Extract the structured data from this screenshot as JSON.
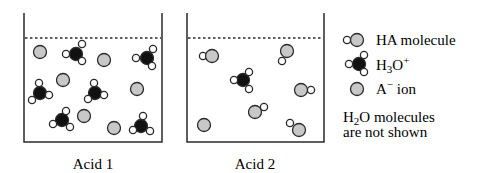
{
  "colors": {
    "stroke": "#2a2a2a",
    "gray_fill": "#c8c8c8",
    "black_fill": "#111111",
    "hydrogen_fill": "#ffffff"
  },
  "beakers": [
    {
      "label": "Acid 1",
      "x": 24,
      "y": 13,
      "width": 138,
      "height": 129,
      "dashed_y": 38,
      "label_x": 93,
      "h3o": [
        {
          "x": 76,
          "y": 54,
          "h": [
            [
              66,
              54
            ],
            [
              82,
              44
            ],
            [
              82,
              61
            ]
          ]
        },
        {
          "x": 147,
          "y": 58,
          "h": [
            [
              136,
              58
            ],
            [
              153,
              49
            ],
            [
              152,
              66
            ]
          ]
        },
        {
          "x": 40,
          "y": 93,
          "h": [
            [
              39,
              83
            ],
            [
              32,
              100
            ],
            [
              49,
              95
            ]
          ]
        },
        {
          "x": 95,
          "y": 93,
          "h": [
            [
              94,
              83
            ],
            [
              88,
              99
            ],
            [
              104,
              95
            ]
          ]
        },
        {
          "x": 62,
          "y": 120,
          "h": [
            [
              66,
              111
            ],
            [
              53,
              124
            ],
            [
              70,
              127
            ]
          ]
        },
        {
          "x": 141,
          "y": 126,
          "h": [
            [
              143,
              116
            ],
            [
              133,
              130
            ],
            [
              150,
              131
            ]
          ]
        }
      ],
      "a_minus": [
        [
          40,
          52
        ],
        [
          104,
          60
        ],
        [
          63,
          80
        ],
        [
          137,
          89
        ],
        [
          84,
          116
        ],
        [
          114,
          128
        ]
      ],
      "ha": []
    },
    {
      "label": "Acid 2",
      "x": 187,
      "y": 13,
      "width": 137,
      "height": 129,
      "dashed_y": 38,
      "label_x": 255,
      "h3o": [
        {
          "x": 243,
          "y": 80,
          "h": [
            [
              234,
              80
            ],
            [
              249,
              72
            ],
            [
              249,
              89
            ]
          ]
        }
      ],
      "a_minus": [
        [
          204,
          125
        ]
      ],
      "ha": [
        {
          "x": 212,
          "y": 56,
          "h": [
            203,
            56
          ]
        },
        {
          "x": 287,
          "y": 51,
          "h": [
            282,
            61
          ]
        },
        {
          "x": 301,
          "y": 90,
          "h": [
            311,
            90
          ]
        },
        {
          "x": 255,
          "y": 112,
          "h": [
            264,
            107
          ]
        },
        {
          "x": 299,
          "y": 130,
          "h": [
            290,
            123
          ]
        }
      ]
    }
  ],
  "legend": {
    "items": [
      {
        "key": "ha",
        "label": "HA molecule"
      },
      {
        "key": "h3o",
        "label_main": "H",
        "label_sub": "3",
        "label_rest": "O",
        "label_sup": "+"
      },
      {
        "key": "a_minus",
        "label_main": "A",
        "label_sup": "−",
        "label_rest": " ion"
      }
    ],
    "note_line1_h": "H",
    "note_line1_sub": "2",
    "note_line1_rest": "O molecules",
    "note_line2": "are not shown"
  }
}
